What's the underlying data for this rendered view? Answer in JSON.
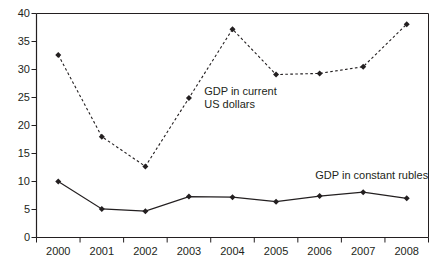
{
  "chart_data": {
    "type": "line",
    "title": "",
    "subtitle": "",
    "xlabel": "",
    "ylabel": "",
    "categories": [
      "2000",
      "2001",
      "2002",
      "2003",
      "2004",
      "2005",
      "2006",
      "2007",
      "2008"
    ],
    "xlim": [
      2000,
      2008
    ],
    "ylim": [
      0,
      40
    ],
    "yticks": [
      0,
      5,
      10,
      15,
      20,
      25,
      30,
      35,
      40
    ],
    "ytick_labels": [
      "0",
      "5",
      "10",
      "15",
      "20",
      "25",
      "30",
      "35",
      "40"
    ],
    "xtick_labels": [
      "2000",
      "2001",
      "2002",
      "2003",
      "2004",
      "2005",
      "2006",
      "2007",
      "2008"
    ],
    "grid": false,
    "legend_position": "inline-annotations",
    "series": [
      {
        "name": "GDP in current US dollars",
        "style": "dashed",
        "marker": "diamond",
        "color": "#231f20",
        "values": [
          32.6,
          18.0,
          12.7,
          24.9,
          37.2,
          29.1,
          29.3,
          30.5,
          38.1
        ]
      },
      {
        "name": "GDP in constant rubles",
        "style": "solid",
        "marker": "diamond",
        "color": "#231f20",
        "values": [
          10.0,
          5.1,
          4.7,
          7.3,
          7.2,
          6.4,
          7.4,
          8.1,
          7.0
        ]
      }
    ],
    "annotations": [
      {
        "id": "annotation-current-usd",
        "lines": [
          "GDP in current",
          "US dollars"
        ],
        "x": 2003.35,
        "y": 26.2
      },
      {
        "id": "annotation-constant-rubles",
        "lines": [
          "GDP in constant rubles"
        ],
        "x": 2005.9,
        "y": 11.1
      }
    ]
  }
}
